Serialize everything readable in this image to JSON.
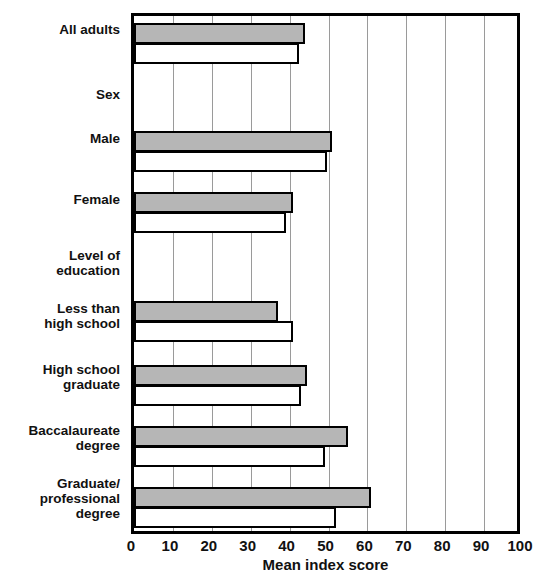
{
  "chart_data": {
    "type": "bar",
    "orientation": "horizontal",
    "title": "",
    "xlabel": "Mean index score",
    "ylabel": "",
    "xlim": [
      0,
      100
    ],
    "xticks": [
      0,
      10,
      20,
      30,
      40,
      50,
      60,
      70,
      80,
      90,
      100
    ],
    "xtick_labels": [
      "0",
      "10",
      "20",
      "30",
      "40",
      "50",
      "60",
      "70",
      "80",
      "90",
      "100"
    ],
    "grid": true,
    "grid_axis": "x",
    "legend": null,
    "categories": [
      "All adults",
      "Sex",
      "Male",
      "Female",
      "Level of\neducation",
      "Less than\nhigh school",
      "High school\ngraduate",
      "Baccalaureate\ndegree",
      "Graduate/\nprofessional\ndegree"
    ],
    "category_types": [
      "data",
      "header",
      "data",
      "data",
      "header",
      "data",
      "data",
      "data",
      "data"
    ],
    "series": [
      {
        "name": "series-gray",
        "fill": "#b6b6b6",
        "values": [
          44,
          null,
          51,
          41,
          null,
          37,
          44.5,
          55,
          61
        ]
      },
      {
        "name": "series-white",
        "fill": "#ffffff",
        "values": [
          42.5,
          null,
          49.5,
          39,
          null,
          41,
          43,
          49,
          52
        ]
      }
    ],
    "colors": {
      "series_gray": "#b6b6b6",
      "series_white": "#ffffff",
      "axis": "#000000",
      "gridline": "#9a9a9a",
      "text": "#111111"
    }
  },
  "layout": {
    "plot": {
      "left": 131,
      "top": 13,
      "width": 389,
      "height": 521
    },
    "rows": [
      {
        "label_y": 22,
        "label_lines": 1,
        "gray_y": 20,
        "white_y": 40,
        "bar_h": 21
      },
      {
        "label_y": 87,
        "label_lines": 1
      },
      {
        "label_y": 131,
        "label_lines": 1,
        "gray_y": 128,
        "white_y": 148,
        "bar_h": 21
      },
      {
        "label_y": 192,
        "label_lines": 1,
        "gray_y": 189,
        "white_y": 209,
        "bar_h": 21
      },
      {
        "label_y": 248,
        "label_lines": 2
      },
      {
        "label_y": 301,
        "label_lines": 2,
        "gray_y": 298,
        "white_y": 318,
        "bar_h": 21
      },
      {
        "label_y": 362,
        "label_lines": 2,
        "gray_y": 362,
        "white_y": 382,
        "bar_h": 21
      },
      {
        "label_y": 423,
        "label_lines": 2,
        "gray_y": 423,
        "white_y": 443,
        "bar_h": 21
      },
      {
        "label_y": 476,
        "label_lines": 3,
        "gray_y": 484,
        "white_y": 504,
        "bar_h": 21
      }
    ]
  }
}
